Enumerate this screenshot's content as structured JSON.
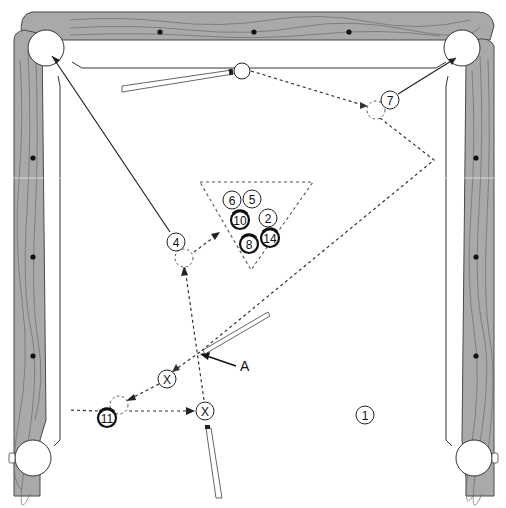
{
  "diagram": {
    "annotation": {
      "label": "A",
      "x": 240,
      "y": 366
    },
    "table": {
      "wood_color": "#a9a9a9",
      "felt_color": "#ffffff",
      "line_color": "#333333",
      "top_diamonds": [
        {
          "x": 160,
          "y": 32
        },
        {
          "x": 254,
          "y": 32
        },
        {
          "x": 349,
          "y": 32
        }
      ],
      "left_diamonds": [
        {
          "x": 33,
          "y": 158
        },
        {
          "x": 33,
          "y": 257
        },
        {
          "x": 33,
          "y": 356
        }
      ],
      "right_diamonds": [
        {
          "x": 476,
          "y": 158
        },
        {
          "x": 476,
          "y": 257
        },
        {
          "x": 476,
          "y": 356
        }
      ],
      "pockets": [
        {
          "name": "top-left",
          "x": 46,
          "y": 48,
          "r": 18
        },
        {
          "name": "top-right",
          "x": 462,
          "y": 48,
          "r": 18
        },
        {
          "name": "bottom-left",
          "x": 33,
          "y": 458,
          "r": 18
        },
        {
          "name": "bottom-right",
          "x": 474,
          "y": 458,
          "r": 18
        }
      ]
    },
    "balls": [
      {
        "label": "6",
        "x": 232,
        "y": 200,
        "stripe": false
      },
      {
        "label": "5",
        "x": 252,
        "y": 199,
        "stripe": false
      },
      {
        "label": "10",
        "x": 240,
        "y": 220,
        "stripe": true
      },
      {
        "label": "2",
        "x": 268,
        "y": 218,
        "stripe": false
      },
      {
        "label": "14",
        "x": 270,
        "y": 238,
        "stripe": true
      },
      {
        "label": "8",
        "x": 249,
        "y": 244,
        "stripe": true
      },
      {
        "label": "4",
        "x": 176,
        "y": 242,
        "stripe": false
      },
      {
        "label": "7",
        "x": 390,
        "y": 100,
        "stripe": false
      },
      {
        "label": "11",
        "x": 107,
        "y": 418,
        "stripe": true
      },
      {
        "label": "1",
        "x": 365,
        "y": 415,
        "stripe": false
      },
      {
        "label": "X",
        "x": 167,
        "y": 379,
        "stripe": false
      },
      {
        "label": "X",
        "x": 205,
        "y": 411,
        "stripe": false
      }
    ],
    "cue_ball": {
      "x": 242,
      "y": 71,
      "r": 8
    },
    "ghost_balls": [
      {
        "x": 376,
        "y": 110
      },
      {
        "x": 184,
        "y": 258
      },
      {
        "x": 119,
        "y": 405
      }
    ],
    "rack": {
      "points": "200,182 313,182 251,270"
    }
  }
}
